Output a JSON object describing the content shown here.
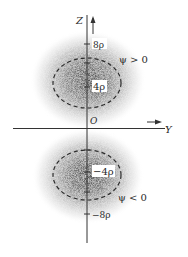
{
  "figure": {
    "axes": {
      "z_label": "Z",
      "y_label": "Y",
      "origin_label": "O"
    },
    "ticks": {
      "z_pos_8": "8ρ",
      "z_pos_4": "4ρ",
      "z_neg_4": "−4ρ",
      "z_neg_8": "−8ρ"
    },
    "lobes": {
      "upper": {
        "sign_label": "ψ > 0"
      },
      "lower": {
        "sign_label": "ψ < 0"
      }
    },
    "colors": {
      "cloud_dark": "#3a3a3a",
      "axis": "#333333"
    }
  }
}
